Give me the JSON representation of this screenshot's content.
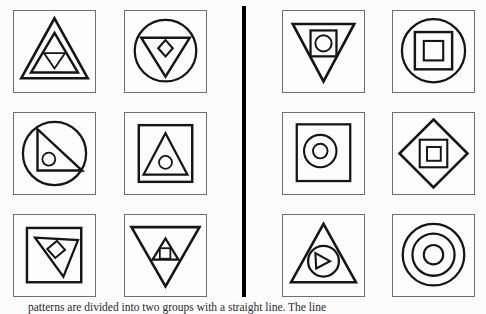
{
  "figure": {
    "caption": "patterns are divided into two groups with a straight line. The line",
    "background": "#fcfcfc",
    "panel_border_color": "#6f6f6f",
    "shape_color": "#151515",
    "divider_color": "#000000"
  },
  "panels": [
    {
      "id": "left-1",
      "group": "left",
      "description": "three nested triangles: two upward, innermost inverted",
      "shapes": [
        {
          "name": "outer-up-triangle",
          "t": "poly",
          "pts": "50,9 91,83 9,83",
          "sw": 3.2
        },
        {
          "name": "middle-up-triangle",
          "t": "poly",
          "pts": "50,27 79,76 21,76",
          "sw": 3
        },
        {
          "name": "inner-down-triangle",
          "t": "poly",
          "pts": "37,52 63,52 50,71",
          "sw": 2.2
        }
      ]
    },
    {
      "id": "left-2",
      "group": "left",
      "description": "circle containing inverted triangle containing diamond",
      "shapes": [
        {
          "name": "outer-circle",
          "t": "circle",
          "cx": 50,
          "cy": 49,
          "r": 38,
          "sw": 2.8
        },
        {
          "name": "down-triangle",
          "t": "poly",
          "pts": "20,33 80,33 50,81",
          "sw": 3
        },
        {
          "name": "inner-diamond",
          "t": "poly",
          "pts": "50,36 59,46 50,56 41,46",
          "sw": 2.6
        }
      ]
    },
    {
      "id": "left-3",
      "group": "left",
      "description": "circle containing right triangle containing small circle",
      "shapes": [
        {
          "name": "outer-circle",
          "t": "circle",
          "cx": 50,
          "cy": 50,
          "r": 39,
          "sw": 2.8
        },
        {
          "name": "right-triangle",
          "t": "poly",
          "pts": "29,20 29,71 84,71",
          "sw": 3
        },
        {
          "name": "inner-circle",
          "t": "circle",
          "cx": 43,
          "cy": 57,
          "r": 8,
          "sw": 2.2
        }
      ]
    },
    {
      "id": "left-4",
      "group": "left",
      "description": "square containing upward triangle containing small circle",
      "shapes": [
        {
          "name": "inner-square",
          "t": "rect",
          "x": 17,
          "y": 15,
          "wd": 66,
          "ht": 70,
          "sw": 3
        },
        {
          "name": "up-triangle",
          "t": "poly",
          "pts": "50,25 77,76 23,76",
          "sw": 2.8
        },
        {
          "name": "inner-circle",
          "t": "circle",
          "cx": 50,
          "cy": 61,
          "r": 8,
          "sw": 2.2
        }
      ]
    },
    {
      "id": "left-5",
      "group": "left",
      "description": "square containing tilted inverted triangle containing tilted square",
      "shapes": [
        {
          "name": "inner-square",
          "t": "rect",
          "x": 16,
          "y": 16,
          "wd": 67,
          "ht": 67,
          "sw": 3
        },
        {
          "name": "tilted-down-triangle",
          "t": "poly",
          "pts": "26,28 79,31 61,76",
          "sw": 2.8
        },
        {
          "name": "tilted-square",
          "t": "poly",
          "pts": "41,42 53,32 63,43 51,53",
          "sw": 2.4
        }
      ]
    },
    {
      "id": "left-6",
      "group": "left",
      "description": "inverted triangle containing small upward triangle containing square",
      "shapes": [
        {
          "name": "outer-down-triangle",
          "t": "poly",
          "pts": "8,15 92,15 50,88",
          "sw": 3.2
        },
        {
          "name": "inner-up-triangle",
          "t": "poly",
          "pts": "50,29 66,55 34,55",
          "sw": 2.8
        },
        {
          "name": "inner-square",
          "t": "rect",
          "x": 43,
          "y": 41,
          "wd": 13,
          "ht": 13,
          "sw": 2.2
        }
      ]
    },
    {
      "id": "right-1",
      "group": "right",
      "description": "inverted triangle containing square containing circle",
      "shapes": [
        {
          "name": "outer-down-triangle",
          "t": "poly",
          "pts": "12,16 88,16 50,87",
          "sw": 3.2
        },
        {
          "name": "inner-square",
          "t": "rect",
          "x": 34,
          "y": 24,
          "wd": 32,
          "ht": 32,
          "sw": 2.8
        },
        {
          "name": "inner-circle",
          "t": "circle",
          "cx": 50,
          "cy": 40,
          "r": 10,
          "sw": 2.4
        }
      ]
    },
    {
      "id": "right-2",
      "group": "right",
      "description": "circle containing square containing smaller square",
      "shapes": [
        {
          "name": "outer-circle",
          "t": "circle",
          "cx": 50,
          "cy": 49,
          "r": 39,
          "sw": 2.8
        },
        {
          "name": "middle-square",
          "t": "rect",
          "x": 27,
          "y": 26,
          "wd": 46,
          "ht": 46,
          "sw": 3
        },
        {
          "name": "inner-square",
          "t": "rect",
          "x": 38,
          "y": 37,
          "wd": 24,
          "ht": 24,
          "sw": 2.6
        }
      ]
    },
    {
      "id": "right-3",
      "group": "right",
      "description": "square containing two concentric circles",
      "shapes": [
        {
          "name": "inner-square",
          "t": "rect",
          "x": 17,
          "y": 14,
          "wd": 66,
          "ht": 70,
          "sw": 2.8
        },
        {
          "name": "outer-circle",
          "t": "circle",
          "cx": 46,
          "cy": 47,
          "r": 20,
          "sw": 2.6
        },
        {
          "name": "inner-circle",
          "t": "circle",
          "cx": 46,
          "cy": 47,
          "r": 9,
          "sw": 2.4
        }
      ]
    },
    {
      "id": "right-4",
      "group": "right",
      "description": "diamond containing square containing smaller square",
      "shapes": [
        {
          "name": "outer-diamond",
          "t": "poly",
          "pts": "50,8 92,50 50,92 8,50",
          "sw": 3.2
        },
        {
          "name": "middle-square",
          "t": "rect",
          "x": 33,
          "y": 33,
          "wd": 34,
          "ht": 34,
          "sw": 2.6
        },
        {
          "name": "inner-square",
          "t": "rect",
          "x": 42,
          "y": 42,
          "wd": 17,
          "ht": 17,
          "sw": 2.4
        }
      ]
    },
    {
      "id": "right-5",
      "group": "right",
      "description": "upward triangle containing circle containing right-pointing triangle",
      "shapes": [
        {
          "name": "outer-up-triangle",
          "t": "poly",
          "pts": "50,11 90,83 10,83",
          "sw": 3.2
        },
        {
          "name": "inner-circle",
          "t": "circle",
          "cx": 50,
          "cy": 57,
          "r": 19,
          "sw": 2.8
        },
        {
          "name": "right-pointing-triangle",
          "t": "poly",
          "pts": "40,47 41,66 58,57",
          "sw": 2.6
        }
      ]
    },
    {
      "id": "right-6",
      "group": "right",
      "description": "three concentric circles",
      "shapes": [
        {
          "name": "outer-circle",
          "t": "circle",
          "cx": 50,
          "cy": 49,
          "r": 38,
          "sw": 2.8
        },
        {
          "name": "middle-circle",
          "t": "circle",
          "cx": 50,
          "cy": 49,
          "r": 26,
          "sw": 2.8
        },
        {
          "name": "inner-circle",
          "t": "circle",
          "cx": 50,
          "cy": 49,
          "r": 12,
          "sw": 2.6
        }
      ]
    }
  ]
}
